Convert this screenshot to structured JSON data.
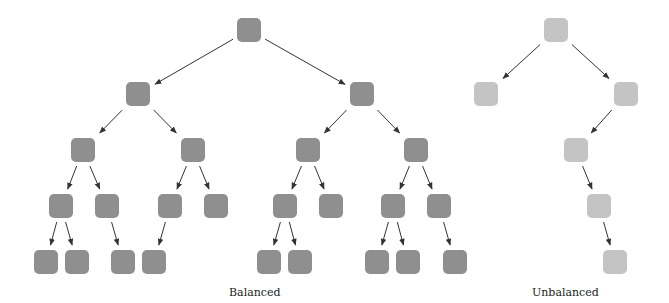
{
  "captions": {
    "balanced": "Balanced",
    "unbalanced": "Unbalanced"
  },
  "colors": {
    "balanced_node": "#8f8f8f",
    "unbalanced_node": "#c4c4c4",
    "edge": "#333333"
  },
  "node_size": 24,
  "trees": [
    {
      "name": "balanced",
      "nodes": {
        "r": [
          237,
          18
        ],
        "a": [
          126,
          82
        ],
        "b": [
          350,
          82
        ],
        "aa": [
          71,
          138
        ],
        "ab": [
          181,
          138
        ],
        "ba": [
          296,
          138
        ],
        "bb": [
          404,
          138
        ],
        "aaa": [
          49,
          194
        ],
        "aab": [
          95,
          194
        ],
        "aba": [
          158,
          194
        ],
        "abb": [
          204,
          194
        ],
        "baa": [
          273,
          194
        ],
        "bab": [
          319,
          194
        ],
        "bba": [
          381,
          194
        ],
        "bbb": [
          427,
          194
        ],
        "l1": [
          34,
          250
        ],
        "l2": [
          65,
          250
        ],
        "l3": [
          111,
          250
        ],
        "l4": [
          142,
          250
        ],
        "l5": [
          257,
          250
        ],
        "l6": [
          288,
          250
        ],
        "l7": [
          365,
          250
        ],
        "l8": [
          396,
          250
        ],
        "l9": [
          443,
          250
        ]
      },
      "edges": [
        [
          "r",
          "a"
        ],
        [
          "r",
          "b"
        ],
        [
          "a",
          "aa"
        ],
        [
          "a",
          "ab"
        ],
        [
          "b",
          "ba"
        ],
        [
          "b",
          "bb"
        ],
        [
          "aa",
          "aaa"
        ],
        [
          "aa",
          "aab"
        ],
        [
          "ab",
          "aba"
        ],
        [
          "ab",
          "abb"
        ],
        [
          "ba",
          "baa"
        ],
        [
          "ba",
          "bab"
        ],
        [
          "bb",
          "bba"
        ],
        [
          "bb",
          "bbb"
        ],
        [
          "aaa",
          "l1"
        ],
        [
          "aaa",
          "l2"
        ],
        [
          "aab",
          "l3"
        ],
        [
          "aba",
          "l4"
        ],
        [
          "baa",
          "l5"
        ],
        [
          "baa",
          "l6"
        ],
        [
          "bba",
          "l7"
        ],
        [
          "bba",
          "l8"
        ],
        [
          "bbb",
          "l9"
        ]
      ]
    },
    {
      "name": "unbalanced",
      "nodes": {
        "r": [
          544,
          18
        ],
        "a": [
          474,
          82
        ],
        "b": [
          614,
          82
        ],
        "c": [
          564,
          138
        ],
        "d": [
          587,
          194
        ],
        "e": [
          603,
          250
        ]
      },
      "edges": [
        [
          "r",
          "a"
        ],
        [
          "r",
          "b"
        ],
        [
          "b",
          "c"
        ],
        [
          "c",
          "d"
        ],
        [
          "d",
          "e"
        ]
      ]
    }
  ]
}
